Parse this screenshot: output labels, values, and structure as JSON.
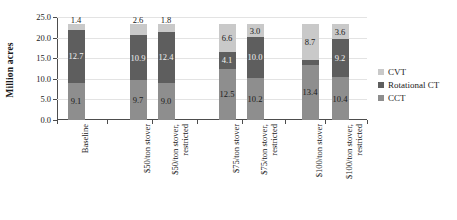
{
  "chart_data": {
    "type": "bar",
    "subtype": "stacked-column",
    "title": "",
    "xlabel": "",
    "ylabel": "Million acres",
    "ylim": [
      0,
      25
    ],
    "yticks": [
      "0.0",
      "5.0",
      "10.0",
      "15.0",
      "20.0",
      "25.0"
    ],
    "ytick_values": [
      0,
      5,
      10,
      15,
      20,
      25
    ],
    "grid": true,
    "legend_position": "right",
    "categories": [
      "Baseline",
      "$50/ton stover",
      "$50/ton stover,\nrestricted",
      "$75/ton stover",
      "$75/ton stover,\nrestricted",
      "$100/ton stover",
      "$100/ton stover,\nrestricted"
    ],
    "series": [
      {
        "name": "CCT",
        "color": "#8e8e8e",
        "values": [
          9.1,
          9.7,
          9.0,
          12.5,
          10.2,
          13.4,
          10.4
        ],
        "labels": [
          "9.1",
          "9.7",
          "9.0",
          "12.5",
          "10.2",
          "13.4",
          "10.4"
        ]
      },
      {
        "name": "Rotational CT",
        "color": "#5e5e5e",
        "values": [
          12.7,
          10.9,
          12.4,
          4.1,
          10.0,
          1.1,
          9.2
        ],
        "labels": [
          "12.7",
          "10.9",
          "12.4",
          "4.1",
          "10.0",
          "1.1",
          "9.2"
        ]
      },
      {
        "name": "CVT",
        "color": "#c9c9c9",
        "values": [
          1.4,
          2.6,
          1.8,
          6.6,
          3.0,
          8.7,
          3.6
        ],
        "labels": [
          "1.4",
          "2.6",
          "1.8",
          "6.6",
          "3.0",
          "8.7",
          "3.6"
        ]
      }
    ],
    "legend": [
      {
        "name": "CVT",
        "color": "#c9c9c9"
      },
      {
        "name": "Rotational CT",
        "color": "#5e5e5e"
      },
      {
        "name": "CCT",
        "color": "#8e8e8e"
      }
    ]
  }
}
